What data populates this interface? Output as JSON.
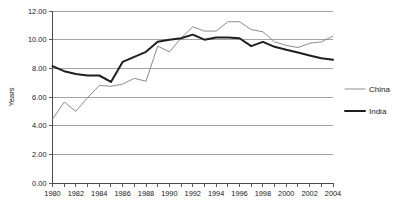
{
  "chart_data": {
    "type": "line",
    "title": "",
    "xlabel": "",
    "ylabel": "Years",
    "ylim": [
      0,
      12
    ],
    "y_ticks": [
      "0.00",
      "2.00",
      "4.00",
      "6.00",
      "8.00",
      "10.00",
      "12.00"
    ],
    "grid": true,
    "legend_position": "right",
    "x": [
      1980,
      1981,
      1982,
      1983,
      1984,
      1985,
      1986,
      1987,
      1988,
      1989,
      1990,
      1991,
      1992,
      1993,
      1994,
      1995,
      1996,
      1997,
      1998,
      1999,
      2000,
      2001,
      2002,
      2003,
      2004
    ],
    "x_tick_labels": [
      "1980",
      "1982",
      "1984",
      "1986",
      "1988",
      "1990",
      "1992",
      "1994",
      "1996",
      "1998",
      "2000",
      "2002",
      "2004"
    ],
    "series": [
      {
        "name": "China",
        "color": "#8c8c8c",
        "width": 1.0,
        "values": [
          4.45,
          5.65,
          5.0,
          5.95,
          6.8,
          6.75,
          6.9,
          7.3,
          7.1,
          9.55,
          9.15,
          10.1,
          10.9,
          10.6,
          10.6,
          11.25,
          11.25,
          10.7,
          10.55,
          9.85,
          9.6,
          9.45,
          9.75,
          9.85,
          10.25
        ]
      },
      {
        "name": "India",
        "color": "#1f1f1f",
        "width": 2.0,
        "values": [
          8.15,
          7.8,
          7.6,
          7.5,
          7.5,
          7.05,
          8.45,
          8.8,
          9.15,
          9.85,
          10.0,
          10.1,
          10.35,
          10.0,
          10.15,
          10.15,
          10.1,
          9.55,
          9.85,
          9.5,
          9.3,
          9.1,
          8.9,
          8.7,
          8.6
        ]
      }
    ]
  },
  "legend": {
    "items": [
      {
        "label": "China"
      },
      {
        "label": "India"
      }
    ]
  }
}
